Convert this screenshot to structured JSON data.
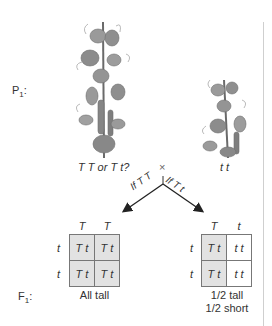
{
  "labels": {
    "p1": "P",
    "p1_sub": "1",
    "f1": "F",
    "f1_sub": "1"
  },
  "parents": {
    "tall_genotype": "T T or T t?",
    "cross_symbol": "×",
    "short_genotype": "t t"
  },
  "arrows": {
    "left_label": "If T T",
    "right_label": "If T t"
  },
  "punnett_left": {
    "col_headers": [
      "T",
      "T"
    ],
    "row_headers": [
      "t",
      "t"
    ],
    "cells": [
      [
        "T t",
        "T t"
      ],
      [
        "T t",
        "T t"
      ]
    ],
    "result": [
      "All tall"
    ]
  },
  "punnett_right": {
    "col_headers": [
      "T",
      "t"
    ],
    "row_headers": [
      "t",
      "t"
    ],
    "cells": [
      [
        "T t",
        "t t"
      ],
      [
        "T t",
        "t t"
      ]
    ],
    "result": [
      "1/2 tall",
      "1/2 short"
    ]
  },
  "colors": {
    "dominant_cell": "#e2e2e2",
    "recessive_cell": "#ffffff",
    "grid_line": "#777777",
    "divider": "#cfcfcf"
  }
}
